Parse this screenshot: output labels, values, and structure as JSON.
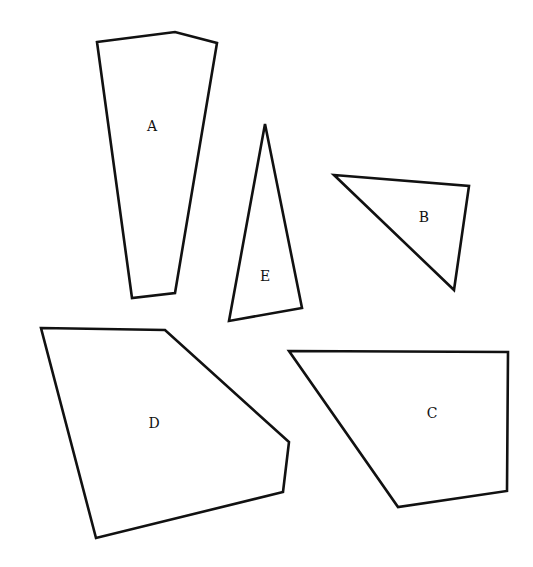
{
  "diagram": {
    "background": "#ffffff",
    "stroke_color": "#111111",
    "shapes": [
      {
        "id": "A",
        "label": "A",
        "points": [
          [
            97,
            42
          ],
          [
            175,
            32
          ],
          [
            217,
            43
          ],
          [
            175,
            293
          ],
          [
            132,
            298
          ]
        ],
        "label_pos": [
          152,
          126
        ]
      },
      {
        "id": "E",
        "label": "E",
        "points": [
          [
            265,
            124
          ],
          [
            302,
            308
          ],
          [
            229,
            321
          ]
        ],
        "label_pos": [
          265,
          276
        ]
      },
      {
        "id": "B",
        "label": "B",
        "points": [
          [
            334,
            175
          ],
          [
            469,
            186
          ],
          [
            454,
            290
          ]
        ],
        "label_pos": [
          424,
          217
        ]
      },
      {
        "id": "D",
        "label": "D",
        "points": [
          [
            41,
            328
          ],
          [
            165,
            330
          ],
          [
            289,
            442
          ],
          [
            283,
            492
          ],
          [
            96,
            538
          ]
        ],
        "label_pos": [
          154,
          423
        ]
      },
      {
        "id": "C",
        "label": "C",
        "points": [
          [
            289,
            351
          ],
          [
            508,
            352
          ],
          [
            507,
            491
          ],
          [
            398,
            507
          ]
        ],
        "label_pos": [
          432,
          413
        ]
      }
    ]
  }
}
